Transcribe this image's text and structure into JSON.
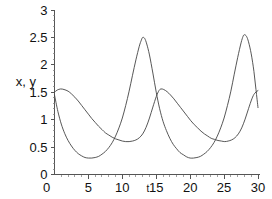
{
  "chart_data": {
    "type": "line",
    "title": "",
    "subtitle": "",
    "xlabel": "t",
    "ylabel": "x, y",
    "xlim": [
      0,
      30
    ],
    "ylim": [
      0,
      3
    ],
    "grid": false,
    "legend": "none",
    "xticks": [
      "0",
      "5",
      "10",
      "15",
      "20",
      "25",
      "30"
    ],
    "xtick_values": [
      0,
      5,
      10,
      15,
      20,
      25,
      30
    ],
    "yticks": [
      "0",
      "0.5",
      "1",
      "1.5",
      "2",
      "2.5",
      "3"
    ],
    "ytick_values": [
      0,
      0.5,
      1,
      1.5,
      2,
      2.5,
      3
    ],
    "series": [
      {
        "name": "x",
        "style": "solid",
        "color": "#444444",
        "description": "sharply peaked oscillation, minima near 0.3, maxima near 2.5",
        "points": [
          [
            0.0,
            1.45
          ],
          [
            0.5,
            1.15
          ],
          [
            1.0,
            0.92
          ],
          [
            1.5,
            0.75
          ],
          [
            2.0,
            0.62
          ],
          [
            2.5,
            0.52
          ],
          [
            3.0,
            0.44
          ],
          [
            3.5,
            0.38
          ],
          [
            4.0,
            0.34
          ],
          [
            4.5,
            0.31
          ],
          [
            5.0,
            0.3
          ],
          [
            5.5,
            0.3
          ],
          [
            6.0,
            0.31
          ],
          [
            6.5,
            0.33
          ],
          [
            7.0,
            0.37
          ],
          [
            7.5,
            0.42
          ],
          [
            8.0,
            0.49
          ],
          [
            8.5,
            0.58
          ],
          [
            9.0,
            0.7
          ],
          [
            9.5,
            0.85
          ],
          [
            10.0,
            1.03
          ],
          [
            10.5,
            1.26
          ],
          [
            11.0,
            1.52
          ],
          [
            11.5,
            1.81
          ],
          [
            12.0,
            2.09
          ],
          [
            12.5,
            2.34
          ],
          [
            12.8,
            2.45
          ],
          [
            13.0,
            2.5
          ],
          [
            13.3,
            2.48
          ],
          [
            13.6,
            2.38
          ],
          [
            14.0,
            2.18
          ],
          [
            14.5,
            1.85
          ],
          [
            15.0,
            1.5
          ],
          [
            15.5,
            1.2
          ],
          [
            16.0,
            0.97
          ],
          [
            16.5,
            0.8
          ],
          [
            17.0,
            0.66
          ],
          [
            17.5,
            0.55
          ],
          [
            18.0,
            0.47
          ],
          [
            18.5,
            0.4
          ],
          [
            19.0,
            0.36
          ],
          [
            19.5,
            0.32
          ],
          [
            20.0,
            0.3
          ],
          [
            20.5,
            0.3
          ],
          [
            21.0,
            0.31
          ],
          [
            21.5,
            0.33
          ],
          [
            22.0,
            0.37
          ],
          [
            22.5,
            0.42
          ],
          [
            23.0,
            0.49
          ],
          [
            23.5,
            0.58
          ],
          [
            24.0,
            0.7
          ],
          [
            24.5,
            0.85
          ],
          [
            25.0,
            1.03
          ],
          [
            25.5,
            1.26
          ],
          [
            26.0,
            1.52
          ],
          [
            26.5,
            1.83
          ],
          [
            27.0,
            2.13
          ],
          [
            27.5,
            2.4
          ],
          [
            27.8,
            2.52
          ],
          [
            28.0,
            2.55
          ],
          [
            28.3,
            2.52
          ],
          [
            28.6,
            2.42
          ],
          [
            29.0,
            2.2
          ],
          [
            29.4,
            1.88
          ],
          [
            29.7,
            1.55
          ],
          [
            30.0,
            1.22
          ]
        ]
      },
      {
        "name": "y",
        "style": "solid",
        "color": "#444444",
        "description": "smooth rounded oscillation, minima plateau near 0.6, maxima near 1.55",
        "points": [
          [
            0.0,
            1.5
          ],
          [
            0.4,
            1.54
          ],
          [
            0.9,
            1.56
          ],
          [
            1.4,
            1.55
          ],
          [
            2.0,
            1.52
          ],
          [
            2.5,
            1.47
          ],
          [
            3.0,
            1.41
          ],
          [
            3.5,
            1.34
          ],
          [
            4.0,
            1.26
          ],
          [
            4.5,
            1.18
          ],
          [
            5.0,
            1.1
          ],
          [
            5.5,
            1.02
          ],
          [
            6.0,
            0.95
          ],
          [
            6.5,
            0.88
          ],
          [
            7.0,
            0.82
          ],
          [
            7.5,
            0.76
          ],
          [
            8.0,
            0.72
          ],
          [
            8.5,
            0.68
          ],
          [
            9.0,
            0.65
          ],
          [
            9.5,
            0.63
          ],
          [
            10.0,
            0.61
          ],
          [
            10.5,
            0.6
          ],
          [
            11.0,
            0.6
          ],
          [
            11.5,
            0.61
          ],
          [
            12.0,
            0.63
          ],
          [
            12.5,
            0.67
          ],
          [
            13.0,
            0.74
          ],
          [
            13.5,
            0.86
          ],
          [
            14.0,
            1.03
          ],
          [
            14.5,
            1.23
          ],
          [
            15.0,
            1.42
          ],
          [
            15.4,
            1.53
          ],
          [
            15.7,
            1.56
          ],
          [
            16.1,
            1.55
          ],
          [
            16.6,
            1.51
          ],
          [
            17.1,
            1.45
          ],
          [
            17.6,
            1.38
          ],
          [
            18.1,
            1.3
          ],
          [
            18.6,
            1.22
          ],
          [
            19.1,
            1.14
          ],
          [
            19.6,
            1.06
          ],
          [
            20.1,
            0.98
          ],
          [
            20.6,
            0.91
          ],
          [
            21.1,
            0.85
          ],
          [
            21.6,
            0.79
          ],
          [
            22.1,
            0.74
          ],
          [
            22.6,
            0.7
          ],
          [
            23.1,
            0.66
          ],
          [
            23.6,
            0.64
          ],
          [
            24.1,
            0.62
          ],
          [
            24.6,
            0.61
          ],
          [
            25.1,
            0.6
          ],
          [
            25.6,
            0.61
          ],
          [
            26.1,
            0.63
          ],
          [
            26.6,
            0.67
          ],
          [
            27.1,
            0.74
          ],
          [
            27.6,
            0.85
          ],
          [
            28.1,
            1.01
          ],
          [
            28.6,
            1.2
          ],
          [
            29.1,
            1.38
          ],
          [
            29.5,
            1.48
          ],
          [
            30.0,
            1.53
          ]
        ]
      }
    ]
  },
  "axes": {
    "y_axis_label": "x, y",
    "x_axis_label": "t"
  }
}
